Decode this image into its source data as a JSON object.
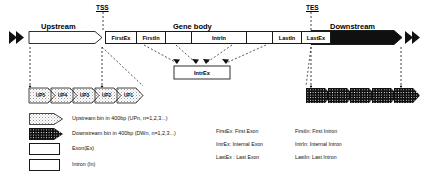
{
  "figure": {
    "markers": {
      "tss": "TSS",
      "tes": "TES"
    },
    "sections": {
      "upstream": "Upstream",
      "gene_body": "Gene body",
      "downstream": "Downstream"
    },
    "gene_segments": [
      {
        "id": "first-exon",
        "label": "FirstEx",
        "type": "exon"
      },
      {
        "id": "first-intron",
        "label": "FirstIn",
        "type": "intron"
      },
      {
        "id": "internal-exon-1",
        "label": "",
        "type": "exon"
      },
      {
        "id": "internal-intron",
        "label": "IntrIn",
        "type": "intron"
      },
      {
        "id": "internal-exon-2",
        "label": "",
        "type": "exon"
      },
      {
        "id": "last-intron",
        "label": "LastIn",
        "type": "intron"
      },
      {
        "id": "last-exon",
        "label": "LastEx",
        "type": "exon"
      }
    ],
    "callout": {
      "label": "IntrEx"
    },
    "upstream_bins": [
      {
        "label": "UP5"
      },
      {
        "label": "UP4"
      },
      {
        "label": "UP3"
      },
      {
        "label": "UP2"
      },
      {
        "label": "UP1"
      }
    ],
    "downstream_bins": [
      {
        "label": "DW1"
      },
      {
        "label": "DW2"
      },
      {
        "label": "DW3"
      },
      {
        "label": "DW4"
      },
      {
        "label": "DW5"
      }
    ]
  },
  "legend": {
    "items": [
      {
        "key": "upstream-bin",
        "text": "Upstream bin in 400bp (UPn, n=1,2,3...)"
      },
      {
        "key": "downstream-bin",
        "text": "Downstream bin in 400bp  (DWn, n=1,2,3...)"
      },
      {
        "key": "exon",
        "text": "Exon(Ex)"
      },
      {
        "key": "intron",
        "text": "Intron (In)"
      }
    ]
  },
  "definitions": {
    "left_column": [
      "FirstEx: First Exon",
      "IntrEx: Internal Exon",
      "LastEx : Last Exon"
    ],
    "right_column": [
      "FirstIn: First Intron",
      "IntrIn: Internal Intron",
      "LastIn: Last Intron"
    ]
  },
  "colors": {
    "stroke": "#1a1a1a",
    "dark_fill": "#101010",
    "light_fill": "#ffffff",
    "dash": "#2a2a2a"
  }
}
